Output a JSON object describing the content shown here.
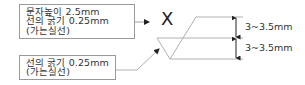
{
  "callouts": [
    {
      "lines": [
        "문자높이 2.5mm",
        "선의 굵기 0.25mm",
        "(가는실선)"
      ]
    },
    {
      "lines": [
        "선의 굵기 0.25mm",
        "(가는실선)"
      ]
    }
  ],
  "symbol": {
    "label": "X"
  },
  "dimensions": [
    {
      "label": "3~3.5mm"
    },
    {
      "label": "3~3.5mm"
    }
  ],
  "colors": {
    "line": "#b0b0b0",
    "text": "#333333",
    "box_border": "#9a9a9a"
  }
}
